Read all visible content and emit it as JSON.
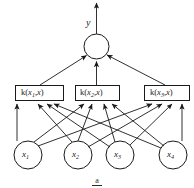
{
  "figure": {
    "type": "neural-network-diagram",
    "title": "",
    "output": {
      "label": "y"
    },
    "sum_node": {
      "label": ""
    },
    "hidden_layer": {
      "nodes": [
        {
          "prefix": "k(",
          "var": "x",
          "sub": "1",
          "mid": ",",
          "var2": "x",
          "suffix": ")"
        },
        {
          "prefix": "k(",
          "var": "x",
          "sub": "2",
          "mid": ",",
          "var2": "x",
          "suffix": ")"
        },
        {
          "prefix": "k(",
          "var": "x",
          "sub": "3",
          "mid": ",",
          "var2": "x",
          "suffix": ")"
        }
      ],
      "labels": [
        "k(x1,x)",
        "k(x2,x)",
        "k(x3,x)"
      ]
    },
    "input_layer": {
      "nodes": [
        {
          "var": "x",
          "sub": "1"
        },
        {
          "var": "x",
          "sub": "2"
        },
        {
          "var": "x",
          "sub": "3"
        },
        {
          "var": "x",
          "sub": "4"
        }
      ],
      "labels": [
        "x1",
        "x2",
        "x3",
        "x4"
      ]
    },
    "caption": {
      "text": "a"
    },
    "colors": {
      "stroke": "#1a1a1a",
      "background": "#ffffff",
      "text": "#1a1a1a"
    }
  }
}
